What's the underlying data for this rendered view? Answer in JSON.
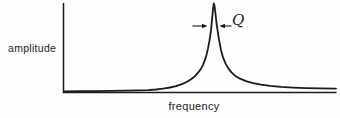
{
  "figure": {
    "y_axis_label": "amplitude",
    "x_axis_label": "frequency",
    "q_label": "Q"
  },
  "colors": {
    "ink": "#1c1c1c",
    "background": "#fdfdfc"
  },
  "chart_data": {
    "type": "line",
    "title": "",
    "xlabel": "frequency",
    "ylabel": "amplitude",
    "x_ticks": [],
    "y_ticks": [],
    "grid": false,
    "legend": false,
    "peak_x_fraction": 0.55,
    "points_px": [
      [
        64,
        91.3
      ],
      [
        80,
        91.2
      ],
      [
        95,
        91.1
      ],
      [
        110,
        90.9
      ],
      [
        125,
        90.7
      ],
      [
        138,
        90.4
      ],
      [
        148,
        90.1
      ],
      [
        156,
        89.5
      ],
      [
        163,
        88.7
      ],
      [
        170,
        87.5
      ],
      [
        176,
        86.1
      ],
      [
        182,
        84.1
      ],
      [
        187,
        81.8
      ],
      [
        191,
        79.2
      ],
      [
        195,
        76.1
      ],
      [
        198,
        72.7
      ],
      [
        201,
        68.7
      ],
      [
        203,
        64.8
      ],
      [
        205,
        59.9
      ],
      [
        206.5,
        54.9
      ],
      [
        208,
        48.4
      ],
      [
        209.5,
        40.4
      ],
      [
        211,
        30.4
      ],
      [
        212,
        19.9
      ],
      [
        213,
        8.9
      ],
      [
        213.8,
        3.5
      ],
      [
        214.6,
        6.0
      ],
      [
        215.5,
        14.0
      ],
      [
        216.5,
        23.0
      ],
      [
        218,
        33.4
      ],
      [
        219.5,
        42.4
      ],
      [
        221,
        49.9
      ],
      [
        223,
        57.4
      ],
      [
        225.5,
        63.4
      ],
      [
        228,
        67.9
      ],
      [
        231,
        71.9
      ],
      [
        235,
        75.7
      ],
      [
        240,
        78.7
      ],
      [
        246,
        81.2
      ],
      [
        253,
        83.1
      ],
      [
        261,
        84.7
      ],
      [
        270,
        85.9
      ],
      [
        281,
        86.9
      ],
      [
        293,
        87.6
      ],
      [
        306,
        88.1
      ],
      [
        320,
        88.4
      ],
      [
        336,
        88.6
      ]
    ]
  },
  "geometry_px": {
    "y_axis": {
      "x": 63.5,
      "y1": 3.5,
      "y2": 92.5
    },
    "x_axis": {
      "x1": 63.5,
      "x2": 336,
      "y": 92.5
    },
    "arrows": {
      "y": 26,
      "left": {
        "x_start": 192.5,
        "x_end": 206,
        "tip": 207.5
      },
      "right": {
        "x_start": 231.5,
        "x_end": 221,
        "tip": 219.5
      }
    }
  }
}
